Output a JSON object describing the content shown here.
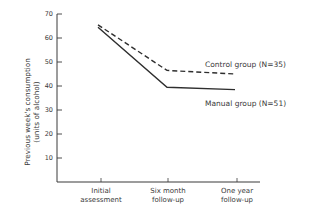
{
  "chart_data": {
    "type": "line",
    "title": "",
    "xlabel": "",
    "ylabel": "Previous week's consumption (units of alcohol)",
    "ylabel_lines": [
      "Previous week's consumption",
      "(units of alcohol)"
    ],
    "ylim": [
      0,
      70
    ],
    "yticks": [
      10,
      20,
      30,
      40,
      50,
      60,
      70
    ],
    "categories": [
      "Initial assessment",
      "Six month follow-up",
      "One year follow-up"
    ],
    "category_lines": [
      [
        "Initial",
        "assessment"
      ],
      [
        "Six month",
        "follow-up"
      ],
      [
        "One year",
        "follow-up"
      ]
    ],
    "series": [
      {
        "name": "Control group (N=35)",
        "style": "dashed",
        "values": [
          65.5,
          46.5,
          45
        ]
      },
      {
        "name": "Manual group (N=51)",
        "style": "solid",
        "values": [
          64.5,
          39.5,
          38.5
        ]
      }
    ],
    "grid": false,
    "legend_position": "inline-right"
  }
}
